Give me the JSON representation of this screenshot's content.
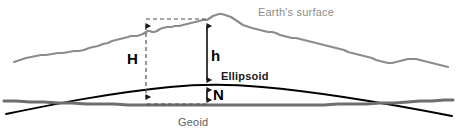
{
  "figure": {
    "surfaces": {
      "earth": {
        "label": "Earth's surface",
        "color": "#8c8c8c"
      },
      "ellipsoid": {
        "label": "Ellipsoid",
        "color": "#000000"
      },
      "geoid": {
        "label": "Geoid",
        "color": "#6e6e6e"
      }
    },
    "measures": [
      {
        "symbol": "H",
        "name": "orthometric-height",
        "from": "geoid",
        "to": "earth-surface",
        "style": "dashed"
      },
      {
        "symbol": "h",
        "name": "ellipsoidal-height",
        "from": "ellipsoid",
        "to": "earth-surface",
        "style": "solid"
      },
      {
        "symbol": "N",
        "name": "geoid-undulation",
        "from": "geoid",
        "to": "ellipsoid",
        "style": "solid"
      }
    ]
  },
  "labels": {
    "earth_surface": "Earth's surface",
    "ellipsoid": "Ellipsoid",
    "geoid": "Geoid",
    "H": "H",
    "h": "h",
    "N": "N"
  },
  "colors": {
    "background": "#ffffff",
    "earth_line": "#8c8c8c",
    "ellipsoid_line": "#000000",
    "geoid_line": "#6e6e6e",
    "measure_line": "#1a1a1a",
    "dashed_line": "#4d4d4d"
  }
}
